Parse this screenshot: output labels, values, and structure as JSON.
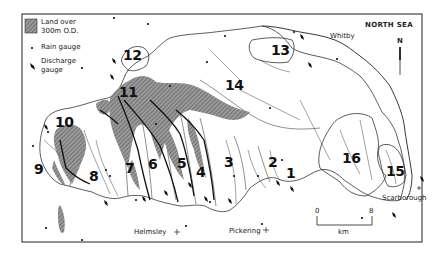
{
  "legend": {
    "items": [
      {
        "symbol": "hatched-box",
        "label_line1": "Land over",
        "label_line2": "300m O.D."
      },
      {
        "symbol": "dot",
        "label": "Rain gauge"
      },
      {
        "symbol": "diamond",
        "label_line1": "Discharge",
        "label_line2": "gauge"
      }
    ]
  },
  "places": {
    "whitby": "Whitby",
    "scarborough": "Scarborough",
    "helmsley": "Helmsley",
    "pickering": "Pickering"
  },
  "sea_label": "NORTH SEA",
  "north_label": "N",
  "scale": {
    "start": "0",
    "end": "8",
    "unit": "km"
  },
  "catchments": [
    "1",
    "2",
    "3",
    "4",
    "5",
    "6",
    "7",
    "8",
    "9",
    "10",
    "11",
    "12",
    "13",
    "14",
    "15",
    "16"
  ],
  "colors": {
    "ink": "#111111",
    "hatch": "#777777",
    "frame": "#222222",
    "background": "#ffffff"
  }
}
